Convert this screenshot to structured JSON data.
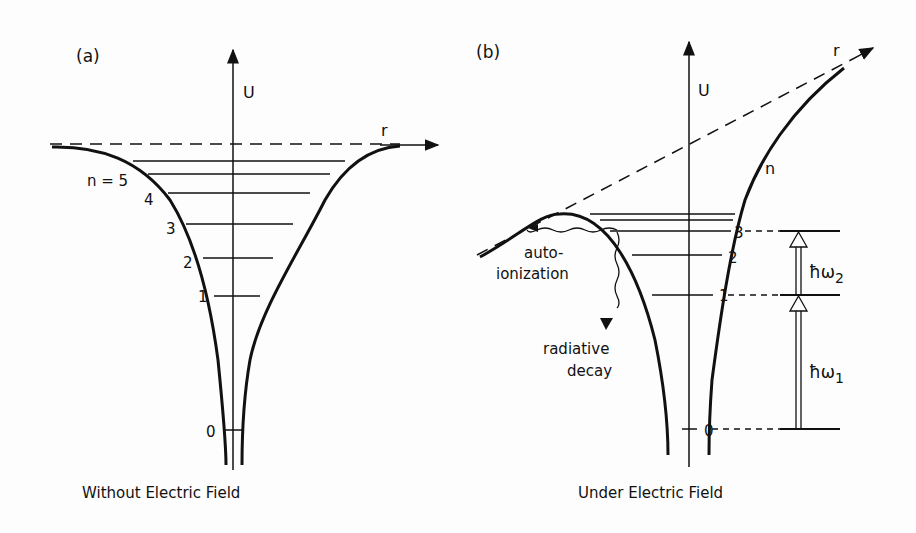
{
  "panel_a": {
    "tag": "(a)",
    "y_axis": "U",
    "x_axis": "r",
    "levels": [
      "n = 5",
      "4",
      "3",
      "2",
      "1",
      "0"
    ],
    "caption": "Without Electric Field"
  },
  "panel_b": {
    "tag": "(b)",
    "y_axis": "U",
    "x_axis": "r",
    "n_label": "n",
    "levels": [
      "3",
      "2",
      "1",
      "0"
    ],
    "autoionization": [
      "auto-",
      "ionization"
    ],
    "radiative": [
      "radiative",
      "decay"
    ],
    "photon1": "ħω",
    "photon1_sub": "1",
    "photon2": "ħω",
    "photon2_sub": "2",
    "caption": "Under Electric Field"
  }
}
